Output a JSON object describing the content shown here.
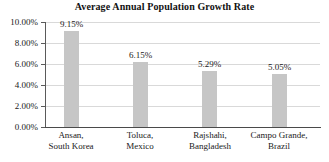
{
  "chart_data": {
    "type": "bar",
    "title": "Average Annual Population Growth Rate",
    "xlabel": "",
    "ylabel": "",
    "ylim": [
      0,
      10
    ],
    "grid": true,
    "legend": "none",
    "yticks": [
      "0.00%",
      "2.00%",
      "4.00%",
      "6.00%",
      "8.00%",
      "10.00%"
    ],
    "ytick_values": [
      0,
      2,
      4,
      6,
      8,
      10
    ],
    "categories": [
      "Ansan, South Korea",
      "Toluca, Mexico",
      "Rajshahi, Bangladesh",
      "Campo Grande, Brazil"
    ],
    "category_lines": [
      {
        "line1": "Ansan,",
        "line2": "South Korea"
      },
      {
        "line1": "Toluca,",
        "line2": "Mexico"
      },
      {
        "line1": "Rajshahi,",
        "line2": "Bangladesh"
      },
      {
        "line1": "Campo Grande,",
        "line2": "Brazil"
      }
    ],
    "values": [
      9.15,
      6.15,
      5.29,
      5.05
    ],
    "data_labels": [
      "9.15%",
      "6.15%",
      "5.29%",
      "5.05%"
    ],
    "bar_color": "#c6c6c6",
    "grid_color": "#d9d9d9",
    "axis_color": "#4a4a4a",
    "text_color": "#1a1a1a"
  }
}
